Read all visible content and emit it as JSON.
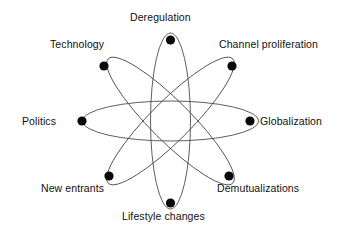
{
  "figure": {
    "type": "atom-diagram",
    "background_color": "#ffffff",
    "orbit_color": "#4c4c4c",
    "node_color": "#0a0a0a",
    "label_color": "#111111",
    "center": {
      "x": 170.5,
      "y": 121
    },
    "node_radius": 4.6,
    "orbit_rx": 88,
    "orbit_ry": 20,
    "orbit_angles": [
      0,
      45,
      90,
      135
    ]
  },
  "nodes": [
    {
      "id": "deregulation",
      "label": "Deregulation",
      "x": 170.5,
      "y": 40,
      "label_x": 130,
      "label_y": 11,
      "anchor": "left"
    },
    {
      "id": "channel-proliferation",
      "label": "Channel proliferation",
      "x": 232,
      "y": 66,
      "label_x": 219,
      "label_y": 38,
      "anchor": "left"
    },
    {
      "id": "globalization",
      "label": "Globalization",
      "x": 250,
      "y": 121,
      "label_x": 260,
      "label_y": 115,
      "anchor": "left"
    },
    {
      "id": "demutualizations",
      "label": "Demutualizations",
      "x": 229,
      "y": 176,
      "label_x": 217,
      "label_y": 182,
      "anchor": "left"
    },
    {
      "id": "lifestyle-changes",
      "label": "Lifestyle changes",
      "x": 170.5,
      "y": 203,
      "label_x": 122,
      "label_y": 210,
      "anchor": "left"
    },
    {
      "id": "new-entrants",
      "label": "New entrants",
      "x": 109,
      "y": 176,
      "label_x": 41,
      "label_y": 182,
      "anchor": "left"
    },
    {
      "id": "politics",
      "label": "Politics",
      "x": 82,
      "y": 121,
      "label_x": 22,
      "label_y": 115,
      "anchor": "left"
    },
    {
      "id": "technology",
      "label": "Technology",
      "x": 104,
      "y": 66,
      "label_x": 50,
      "label_y": 38,
      "anchor": "left"
    }
  ],
  "orbits": [
    {
      "id": "orbit-horizontal",
      "angle": 0,
      "endpoints": [
        "politics",
        "globalization"
      ]
    },
    {
      "id": "orbit-diagonal-down",
      "angle": 45,
      "endpoints": [
        "technology",
        "demutualizations"
      ]
    },
    {
      "id": "orbit-vertical",
      "angle": 90,
      "endpoints": [
        "deregulation",
        "lifestyle-changes"
      ]
    },
    {
      "id": "orbit-diagonal-up",
      "angle": 135,
      "endpoints": [
        "new-entrants",
        "channel-proliferation"
      ]
    }
  ]
}
